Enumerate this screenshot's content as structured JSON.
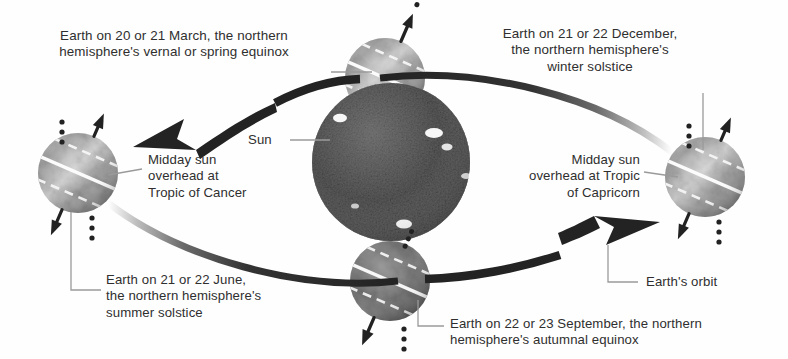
{
  "figure": {
    "type": "astronomy-diagram",
    "background_color": "#fefefe",
    "text_color": "#2f2f2f"
  },
  "sun": {
    "label": "Sun",
    "color": "#4a4a4a",
    "highlight_color": "#ffffff"
  },
  "labels": {
    "march": "Earth on 20 or 21 March, the northern\nhemisphere's vernal or spring equinox",
    "december": "Earth on 21 or 22 December,\nthe northern hemisphere's\nwinter solstice",
    "june": "Earth on 21 or 22 June,\nthe northern hemisphere's\nsummer solstice",
    "september": "Earth on 22 or 23 September, the northern\nhemisphere's autumnal equinox",
    "tropic_cancer": "Midday sun\noverhead at\nTropic of Cancer",
    "tropic_capricorn": "Midday sun\noverhead at Tropic\nof Capricorn",
    "orbit": "Earth's orbit"
  },
  "earths": [
    {
      "name": "earth-march-equinox",
      "position": "top",
      "cx": 385,
      "cy": 78,
      "r": 40,
      "axis_arrow": "up-right",
      "shade": "light"
    },
    {
      "name": "earth-june-solstice",
      "position": "left",
      "cx": 78,
      "cy": 173,
      "r": 40,
      "axis_arrow": "up-right",
      "shade": "light"
    },
    {
      "name": "earth-december-solstice",
      "position": "right",
      "cx": 705,
      "cy": 177,
      "r": 40,
      "axis_arrow": "up-right",
      "shade": "light"
    },
    {
      "name": "earth-september-equinox",
      "position": "bottom",
      "cx": 390,
      "cy": 281,
      "r": 40,
      "axis_arrow": "down-left",
      "shade": "dark"
    }
  ],
  "orbit_arrows": [
    {
      "name": "orbit-arrow-top",
      "direction": "right-to-left",
      "description": "top arc from December Earth to March Earth"
    },
    {
      "name": "orbit-arrow-bottom",
      "direction": "left-to-right",
      "description": "bottom arc from June Earth to September Earth"
    }
  ],
  "colors": {
    "ink": "#2f2f2f",
    "arrow": "#2a2a2a",
    "leader": "#8a8a8a",
    "earth_light_a": "#cfcfcf",
    "earth_light_b": "#8d8d8d",
    "earth_dark_a": "#8a8a8a",
    "earth_dark_b": "#4f4f4f",
    "sun_a": "#6a6a6a",
    "sun_b": "#3c3c3c"
  }
}
